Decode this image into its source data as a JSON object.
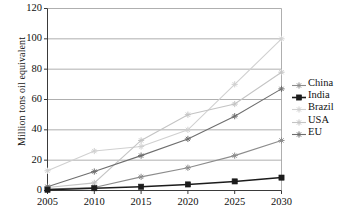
{
  "chart_data": {
    "type": "line",
    "title": "",
    "xlabel": "",
    "ylabel": "Million tons oil equivalent",
    "categories": [
      "2005",
      "2010",
      "2015",
      "2020",
      "2025",
      "2030"
    ],
    "x": [
      2005,
      2010,
      2015,
      2020,
      2025,
      2030
    ],
    "xlim": [
      2005,
      2030
    ],
    "ylim": [
      0,
      120
    ],
    "y_ticks": [
      "0",
      "20",
      "40",
      "60",
      "80",
      "100",
      "120"
    ],
    "y_tick_values": [
      0,
      20,
      40,
      60,
      80,
      100,
      120
    ],
    "grid": "horizontal",
    "legend_position": "right",
    "series": [
      {
        "name": "China",
        "values": [
          1,
          2,
          9,
          15,
          23,
          33
        ],
        "color": "#8c8c8c",
        "marker": "star"
      },
      {
        "name": "India",
        "values": [
          0.5,
          1.5,
          2.5,
          4,
          6,
          8.5
        ],
        "color": "#1c1c1c",
        "marker": "square"
      },
      {
        "name": "Brazil",
        "values": [
          13,
          26,
          29,
          40,
          70,
          100
        ],
        "color": "#d0d0d0",
        "marker": "star"
      },
      {
        "name": "USA",
        "values": [
          2,
          5,
          33,
          50,
          57,
          78
        ],
        "color": "#c4c4c4",
        "marker": "star"
      },
      {
        "name": "EU",
        "values": [
          2.5,
          12.5,
          23,
          34,
          49,
          67
        ],
        "color": "#6e6e6e",
        "marker": "star"
      }
    ]
  },
  "legend": {
    "items": [
      {
        "label": "China"
      },
      {
        "label": "India"
      },
      {
        "label": "Brazil"
      },
      {
        "label": "USA"
      },
      {
        "label": "EU"
      }
    ]
  },
  "axes": {
    "y_title": "Million tons oil equivalent"
  }
}
